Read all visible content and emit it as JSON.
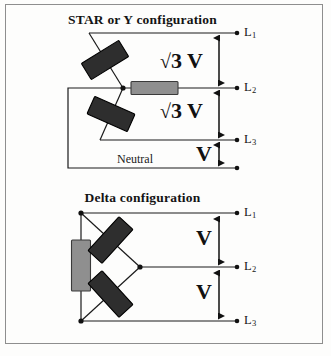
{
  "figure": {
    "width": 331,
    "height": 356,
    "background_color": "#fdfdfc",
    "frame_color": "#8e8e8e"
  },
  "colors": {
    "wire": "#1a1a1a",
    "node": "#111111",
    "resistor_dark_fill": "#2e2e2e",
    "resistor_dark_stroke": "#000000",
    "resistor_light_fill": "#8f8f8f",
    "resistor_light_stroke": "#3a3a3a",
    "text": "#141414"
  },
  "star": {
    "title": "STAR or Y configuration",
    "neutral_label": "Neutral",
    "line_labels": [
      {
        "name": "L",
        "sub": "1"
      },
      {
        "name": "L",
        "sub": "2"
      },
      {
        "name": "L",
        "sub": "3"
      }
    ],
    "voltage_annotations": [
      {
        "id": "star-v-l1-l2",
        "root": "√",
        "text": "3 V",
        "between": "L1-L2"
      },
      {
        "id": "star-v-l2-l3",
        "root": "√",
        "text": "3 V",
        "between": "L2-L3"
      },
      {
        "id": "star-v-l3-n",
        "root": "",
        "text": "V",
        "between": "L3-Neutral"
      }
    ],
    "resistor_count": 3
  },
  "delta": {
    "title": "Delta configuration",
    "line_labels": [
      {
        "name": "L",
        "sub": "1"
      },
      {
        "name": "L",
        "sub": "2"
      },
      {
        "name": "L",
        "sub": "3"
      }
    ],
    "voltage_annotations": [
      {
        "id": "delta-v-l1-l2",
        "root": "",
        "text": "V",
        "between": "L1-L2"
      },
      {
        "id": "delta-v-l2-l3",
        "root": "",
        "text": "V",
        "between": "L2-L3"
      }
    ],
    "resistor_count": 3
  }
}
